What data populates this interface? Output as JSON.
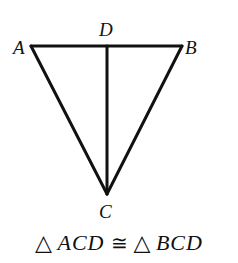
{
  "diagram": {
    "stroke_color": "#111111",
    "vertices": {
      "A": {
        "label": "A",
        "x": 31,
        "y": 46
      },
      "B": {
        "label": "B",
        "x": 182,
        "y": 46
      },
      "C": {
        "label": "C",
        "x": 107,
        "y": 194
      },
      "D": {
        "label": "D",
        "x": 107,
        "y": 46
      }
    },
    "segments": [
      [
        "A",
        "B"
      ],
      [
        "A",
        "C"
      ],
      [
        "B",
        "C"
      ],
      [
        "C",
        "D"
      ]
    ]
  },
  "caption": {
    "triangle_symbol": "△",
    "left_name": "ACD",
    "congruent_symbol": "≅",
    "right_name": "BCD"
  }
}
